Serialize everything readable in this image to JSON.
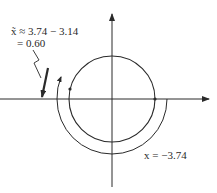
{
  "figure": {
    "annotation_line1": "x̃ ≈ 3.74 − 3.14",
    "annotation_line2": "= 0.60",
    "arc_label": "x = −3.74"
  },
  "colors": {
    "stroke": "#2a2a2a",
    "background": "#ffffff"
  }
}
